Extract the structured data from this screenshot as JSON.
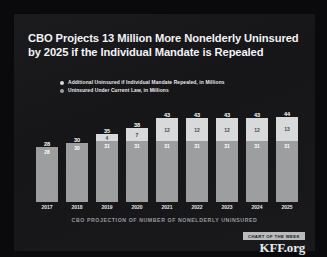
{
  "title": "CBO Projects 13 Million More Nonelderly Uninsured by 2025 if the Individual Mandate is Repealed",
  "legend": {
    "items": [
      {
        "label": "Additional Uninsured if Individual Mandate Repealed, in Millions",
        "color": "#d8d9da"
      },
      {
        "label": "Uninsured Under Current Law, in Millions",
        "color": "#9d9ea0"
      }
    ]
  },
  "caption": "CBO PROJECTION OF NUMBER OF NONELDERLY UNINSURED",
  "branding": {
    "badge": "CHART OF THE WEEK",
    "logo": "KFF.org"
  },
  "chart_data": {
    "type": "bar",
    "title": "CBO Projects 13 Million More Nonelderly Uninsured by 2025 if the Individual Mandate is Repealed",
    "subtitle": "CBO PROJECTION OF NUMBER OF NONELDERLY UNINSURED",
    "stacked": true,
    "xlabel": "",
    "ylabel": "",
    "ylim": [
      0,
      44
    ],
    "grid": false,
    "legend_position": "top",
    "categories": [
      "2017",
      "2018",
      "2019",
      "2020",
      "2021",
      "2022",
      "2023",
      "2024",
      "2025"
    ],
    "series": [
      {
        "name": "Uninsured Under Current Law, in Millions",
        "color": "#9d9ea0",
        "values": [
          28,
          30,
          31,
          31,
          31,
          31,
          31,
          31,
          31
        ]
      },
      {
        "name": "Additional Uninsured if Individual Mandate Repealed, in Millions",
        "color": "#d8d9da",
        "values": [
          0,
          0,
          4,
          7,
          12,
          12,
          12,
          12,
          13
        ]
      }
    ],
    "totals": [
      28,
      30,
      35,
      38,
      43,
      43,
      43,
      43,
      44
    ]
  }
}
